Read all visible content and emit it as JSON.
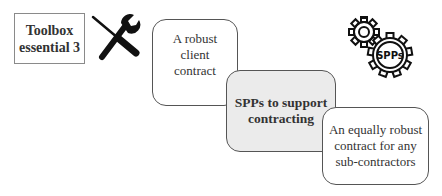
{
  "toolbox": {
    "line1": "Toolbox",
    "line2": "essential 3",
    "icon": "tools-icon"
  },
  "cards": [
    {
      "lines": [
        "A robust",
        "client",
        "contract"
      ],
      "fill": "#ffffff"
    },
    {
      "lines": [
        "SPPs to support",
        "contracting"
      ],
      "fill": "#ebebeb"
    },
    {
      "lines": [
        "An equally robust",
        "contract for any",
        "sub-contractors"
      ],
      "fill": "#ffffff"
    }
  ],
  "gears": {
    "icon": "gears-icon",
    "label": "SPPs"
  }
}
